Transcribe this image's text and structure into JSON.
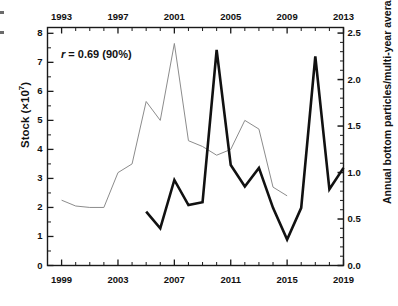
{
  "chart_data": {
    "type": "line",
    "title": "",
    "annotation": "r = 0.69 (90%)",
    "annotation_r_symbol": "r",
    "annotation_rest": " = 0.69 (90%)",
    "grid": false,
    "legend": "none",
    "axes": {
      "top_x": {
        "label": "",
        "min": 1992,
        "max": 2013,
        "ticks": [
          1993,
          1997,
          2001,
          2005,
          2009,
          2013
        ],
        "tick_labels": [
          "1993",
          "1997",
          "2001",
          "2005",
          "2009",
          "2013"
        ],
        "minor_step": 1
      },
      "bottom_x": {
        "label": "",
        "min": 1998,
        "max": 2019,
        "ticks": [
          1999,
          2003,
          2007,
          2011,
          2015,
          2019
        ],
        "tick_labels": [
          "1999",
          "2003",
          "2007",
          "2011",
          "2015",
          "2019"
        ],
        "minor_step": 1
      },
      "left_y": {
        "label": "Stock (×10⁷)",
        "label_base": "Stock (×10",
        "label_exp": "7",
        "label_close": ")",
        "min": 0,
        "max": 8.2,
        "ticks": [
          0,
          1,
          2,
          3,
          4,
          5,
          6,
          7,
          8
        ],
        "tick_labels": [
          "0",
          "1",
          "2",
          "3",
          "4",
          "5",
          "6",
          "7",
          "8"
        ]
      },
      "right_y": {
        "label": "Annual bottom particles/multi-year average",
        "min": 0.0,
        "max": 2.56,
        "ticks": [
          0.0,
          0.5,
          1.0,
          1.5,
          2.0,
          2.5
        ],
        "tick_labels": [
          "0.0",
          "0.5",
          "1.0",
          "1.5",
          "2.0",
          "2.5"
        ]
      }
    },
    "series": [
      {
        "name": "Stock",
        "axis": "left_y",
        "x_axis": "bottom_x",
        "color": "#8c8c8c",
        "line_width": 1.0,
        "x": [
          1999,
          2000,
          2001,
          2002,
          2003,
          2004,
          2005,
          2006,
          2007,
          2008,
          2009,
          2010,
          2011,
          2012,
          2013,
          2014,
          2015
        ],
        "values": [
          2.25,
          2.05,
          2.0,
          2.0,
          3.2,
          3.5,
          5.65,
          5.0,
          7.65,
          4.3,
          4.1,
          3.8,
          4.0,
          5.0,
          4.7,
          2.7,
          2.4
        ]
      },
      {
        "name": "Annual bottom particles/multi-year average",
        "axis": "right_y",
        "x_axis": "bottom_x",
        "color": "#111111",
        "line_width": 2.6,
        "x": [
          2005,
          2006,
          2007,
          2008,
          2009,
          2010,
          2011,
          2012,
          2013,
          2014,
          2015,
          2016,
          2017,
          2018,
          2019
        ],
        "values": [
          0.58,
          0.4,
          0.92,
          0.65,
          0.68,
          2.32,
          1.08,
          0.85,
          1.05,
          0.62,
          0.28,
          0.62,
          2.25,
          0.82,
          1.05
        ]
      }
    ]
  }
}
